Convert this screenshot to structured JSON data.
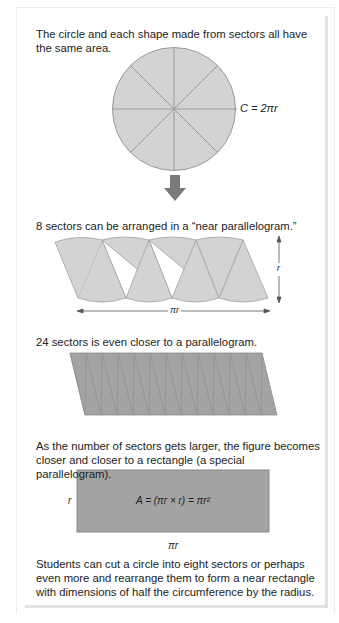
{
  "figure": {
    "intro_text": "The circle and each shape made from sectors all have the same area.",
    "circle": {
      "label": "C = 2πr",
      "sectors": 8
    },
    "arrow": {
      "icon": "down-arrow-icon"
    },
    "step1": {
      "caption": "8 sectors can be arranged in a “near parallelogram.”",
      "sectors": 8,
      "height_label": "r",
      "width_label": "πr"
    },
    "step2": {
      "caption": "24 sectors is even closer to a parallelogram.",
      "sectors": 24
    },
    "step3": {
      "caption": "As the number of sectors gets larger, the figure becomes closer and closer to a rectangle (a special parallelogram).",
      "formula": "A = (πr × r) = πr²",
      "height_label": "r",
      "width_label": "πr"
    },
    "conclusion": "Students can cut a circle into eight sectors or perhaps even more and rearrange them to form a near rectangle with dimensions of half the circumference by the radius."
  },
  "colors": {
    "light_fill": "#d3d3d3",
    "stroke": "#9a9a9a",
    "dark_fill": "#a3a3a3",
    "arrow": "#7a7a7a"
  }
}
